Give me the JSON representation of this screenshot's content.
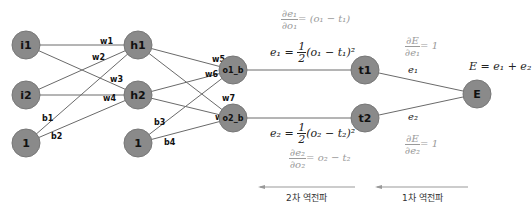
{
  "diagram": {
    "nodes": {
      "i1": "i1",
      "i2": "i2",
      "bias1": "1",
      "h1": "h1",
      "h2": "h2",
      "bias2": "1",
      "o1": "o1_b",
      "o2": "o2_b",
      "t1": "t1",
      "t2": "t2",
      "E": "E"
    },
    "weights": {
      "w1": "w1",
      "w2": "w2",
      "w3": "w3",
      "w4": "w4",
      "w5": "w5",
      "w6": "w6",
      "w7": "w7",
      "w8": "w8",
      "b1": "b1",
      "b2": "b2",
      "b3": "b3",
      "b4": "b4"
    },
    "equations": {
      "de1_num": "∂e₁",
      "de1_den": "∂o₁",
      "de1_rhs": "= (o₁ − t₁)",
      "e1_lhs": "e₁ = ",
      "e1_half_num": "1",
      "e1_half_den": "2",
      "e1_rhs": "(o₁ − t₁)²",
      "e2_lhs": "e₂ = ",
      "e2_half_num": "1",
      "e2_half_den": "2",
      "e2_rhs": "(o₂ − t₂)²",
      "de2_num": "∂e₂",
      "de2_den": "∂o₂",
      "de2_rhs": "= o₂ − t₂",
      "dE1_num": "∂E",
      "dE1_den": "∂e₁",
      "dE1_rhs": "= 1",
      "dE2_num": "∂E",
      "dE2_den": "∂e₂",
      "dE2_rhs": "= 1",
      "e1_edge": "e₁",
      "e2_edge": "e₂",
      "E_def": "E = e₁ + e₂"
    },
    "arrows": {
      "second": "2차 역전파",
      "first": "1차 역전파"
    },
    "colors": {
      "node_fill": "#8a8a8a",
      "edge": "#6a6a6a",
      "light_text": "#9a9a9a"
    }
  }
}
